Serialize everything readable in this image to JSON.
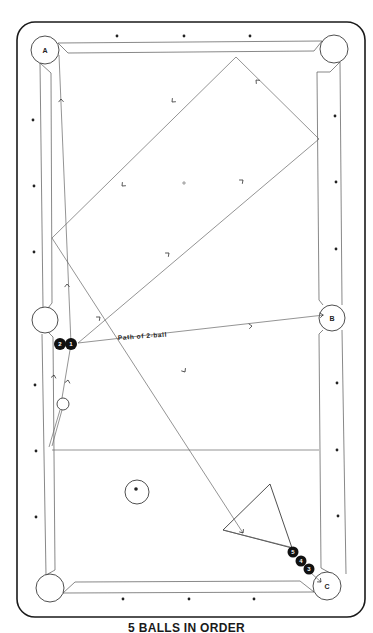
{
  "caption": "5 BALLS IN ORDER",
  "colors": {
    "ink": "#222222",
    "rail_outline": "#1a1a1a",
    "cushion_line": "#555555",
    "path_line": "#666666",
    "ball_fill": "#111111",
    "background": "#ffffff"
  },
  "table": {
    "outer": {
      "x": 17,
      "y": 22,
      "w": 348,
      "h": 595,
      "r": 18
    },
    "play_area": {
      "left": 52,
      "right": 319,
      "top": 54,
      "bottom": 582
    },
    "diamonds": [
      {
        "x": 117,
        "y": 36
      },
      {
        "x": 184,
        "y": 36
      },
      {
        "x": 250,
        "y": 36
      },
      {
        "x": 33,
        "y": 120
      },
      {
        "x": 34,
        "y": 186
      },
      {
        "x": 34,
        "y": 252
      },
      {
        "x": 35,
        "y": 385
      },
      {
        "x": 36,
        "y": 451
      },
      {
        "x": 36,
        "y": 517
      },
      {
        "x": 335,
        "y": 116
      },
      {
        "x": 336,
        "y": 182
      },
      {
        "x": 336,
        "y": 249
      },
      {
        "x": 337,
        "y": 383
      },
      {
        "x": 337,
        "y": 450
      },
      {
        "x": 338,
        "y": 516
      },
      {
        "x": 123,
        "y": 599
      },
      {
        "x": 189,
        "y": 599
      },
      {
        "x": 254,
        "y": 599
      }
    ]
  },
  "pockets": [
    {
      "id": "A",
      "label": "A",
      "cx": 45,
      "cy": 50,
      "r": 14
    },
    {
      "id": "top-right",
      "label": "",
      "cx": 334,
      "cy": 49,
      "r": 14
    },
    {
      "id": "side-left",
      "label": "",
      "cx": 45,
      "cy": 320,
      "r": 13
    },
    {
      "id": "B",
      "label": "B",
      "cx": 332,
      "cy": 318,
      "r": 13
    },
    {
      "id": "bottom-left",
      "label": "",
      "cx": 50,
      "cy": 588,
      "r": 14
    },
    {
      "id": "C",
      "label": "C",
      "cx": 327,
      "cy": 586,
      "r": 14
    }
  ],
  "balls": [
    {
      "number": "2",
      "cx": 60,
      "cy": 344,
      "r": 6
    },
    {
      "number": "1",
      "cx": 71,
      "cy": 344,
      "r": 6
    },
    {
      "number": "5",
      "cx": 293,
      "cy": 552,
      "r": 5.5
    },
    {
      "number": "4",
      "cx": 301,
      "cy": 561,
      "r": 5.5
    },
    {
      "number": "3",
      "cx": 309,
      "cy": 569,
      "r": 5.5
    }
  ],
  "cue_ball": {
    "cx": 63,
    "cy": 404,
    "r": 6
  },
  "object_ball_open": {
    "cx": 137,
    "cy": 492,
    "r": 12,
    "dot_x": 136,
    "dot_y": 489
  },
  "rack_triangle": {
    "points": "223,530 270,484 292,548"
  },
  "center_spot": {
    "x": 184,
    "y": 183
  },
  "head_string": {
    "x1": 52,
    "y1": 450,
    "x2": 319,
    "y2": 450
  },
  "path_label": {
    "text": "Path of 2-ball",
    "x": 118,
    "y": 340,
    "rotate": -4
  },
  "paths": [
    {
      "d": "M71,344 L59,55"
    },
    {
      "d": "M52,238 L236,57 L319,139 L78,343"
    },
    {
      "d": "M52,238 L243,533"
    },
    {
      "d": "M71,344 L62,398"
    },
    {
      "d": "M60,410 L49,447"
    },
    {
      "d": "M62,410 L52,446"
    },
    {
      "d": "M78,343 L324,315"
    },
    {
      "d": "M223,530 L294,548"
    },
    {
      "d": "M311,573 L321,582"
    }
  ],
  "arrows": [
    {
      "x": 61,
      "y": 99,
      "angle": -92
    },
    {
      "x": 67,
      "y": 284,
      "angle": -92
    },
    {
      "x": 68,
      "y": 380,
      "angle": -80
    },
    {
      "x": 54,
      "y": 375,
      "angle": -80
    },
    {
      "x": 122,
      "y": 186,
      "angle": 136
    },
    {
      "x": 172,
      "y": 102,
      "angle": 136
    },
    {
      "x": 256,
      "y": 80,
      "angle": -135
    },
    {
      "x": 243,
      "y": 180,
      "angle": -40
    },
    {
      "x": 169,
      "y": 253,
      "angle": -40
    },
    {
      "x": 100,
      "y": 317,
      "angle": -40
    },
    {
      "x": 252,
      "y": 326,
      "angle": -6
    },
    {
      "x": 323,
      "y": 315,
      "angle": -6
    },
    {
      "x": 185,
      "y": 372,
      "angle": 57
    },
    {
      "x": 243,
      "y": 533,
      "angle": 57
    },
    {
      "x": 321,
      "y": 582,
      "angle": 42
    }
  ]
}
